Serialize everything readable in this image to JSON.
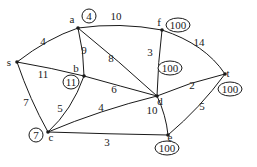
{
  "diagram": {
    "type": "weighted-graph",
    "nodes": [
      {
        "id": "s",
        "label": "s",
        "x": 17,
        "y": 62,
        "lx": 9,
        "ly": 66,
        "dist": null
      },
      {
        "id": "a",
        "label": "a",
        "x": 78,
        "y": 28,
        "lx": 72,
        "ly": 23,
        "dist": "4",
        "dx": 89,
        "dy": 16
      },
      {
        "id": "b",
        "label": "b",
        "x": 84,
        "y": 76,
        "lx": 76,
        "ly": 72,
        "dist": "11",
        "dx": 71,
        "dy": 82
      },
      {
        "id": "f",
        "label": "f",
        "x": 162,
        "y": 30,
        "lx": 159,
        "ly": 26,
        "dist": "100",
        "dx": 178,
        "dy": 25
      },
      {
        "id": "d",
        "label": "d",
        "x": 157,
        "y": 96,
        "lx": 160,
        "ly": 105,
        "dist": "100",
        "dx": 170,
        "dy": 68
      },
      {
        "id": "t",
        "label": "t",
        "x": 225,
        "y": 74,
        "lx": 228,
        "ly": 77,
        "dist": "100",
        "dx": 230,
        "dy": 89
      },
      {
        "id": "c",
        "label": "c",
        "x": 48,
        "y": 132,
        "lx": 51,
        "ly": 141,
        "dist": "7",
        "dx": 36,
        "dy": 135
      },
      {
        "id": "e",
        "label": "e",
        "x": 168,
        "y": 135,
        "lx": 170,
        "ly": 141,
        "dist": "100",
        "dx": 167,
        "dy": 148
      }
    ],
    "edges": [
      {
        "from": "s",
        "to": "a",
        "weight": "4",
        "path": "M17,62 Q48,38 78,28",
        "wx": 43,
        "wy": 45
      },
      {
        "from": "a",
        "to": "f",
        "weight": "10",
        "path": "M78,28 Q120,22 162,30",
        "wx": 116,
        "wy": 20
      },
      {
        "from": "a",
        "to": "b",
        "weight": "9",
        "path": "M78,28 Q84,52 84,76",
        "wx": 84,
        "wy": 54
      },
      {
        "from": "a",
        "to": "d",
        "weight": "8",
        "path": "M78,28 Q120,62 157,96",
        "wx": 111,
        "wy": 62
      },
      {
        "from": "s",
        "to": "b",
        "weight": "11",
        "path": "M17,62 Q52,68 84,76",
        "wx": 43,
        "wy": 78
      },
      {
        "from": "f",
        "to": "d",
        "weight": "3",
        "path": "M162,30 Q158,62 157,96",
        "wx": 150,
        "wy": 56
      },
      {
        "from": "f",
        "to": "t",
        "weight": "14",
        "path": "M162,30 Q205,44 225,74",
        "wx": 199,
        "wy": 46
      },
      {
        "from": "b",
        "to": "d",
        "weight": "6",
        "path": "M84,76 Q120,86 157,96",
        "wx": 114,
        "wy": 93
      },
      {
        "from": "d",
        "to": "t",
        "weight": "2",
        "path": "M157,96 Q190,82 225,74",
        "wx": 192,
        "wy": 89
      },
      {
        "from": "s",
        "to": "c",
        "weight": "7",
        "path": "M17,62 Q30,100 48,132",
        "wx": 26,
        "wy": 106
      },
      {
        "from": "b",
        "to": "c",
        "weight": "5",
        "path": "M84,76 Q72,110 48,132",
        "wx": 60,
        "wy": 112
      },
      {
        "from": "d",
        "to": "c",
        "weight": "4",
        "path": "M157,96 Q100,110 48,132",
        "wx": 101,
        "wy": 111
      },
      {
        "from": "d",
        "to": "e",
        "weight": "10",
        "path": "M157,96 Q166,115 168,135",
        "wx": 152,
        "wy": 114
      },
      {
        "from": "c",
        "to": "e",
        "weight": "3",
        "path": "M48,132 Q108,134 168,135",
        "wx": 107,
        "wy": 146
      },
      {
        "from": "t",
        "to": "e",
        "weight": "5",
        "path": "M225,74 Q200,108 168,135",
        "wx": 202,
        "wy": 110
      }
    ]
  }
}
